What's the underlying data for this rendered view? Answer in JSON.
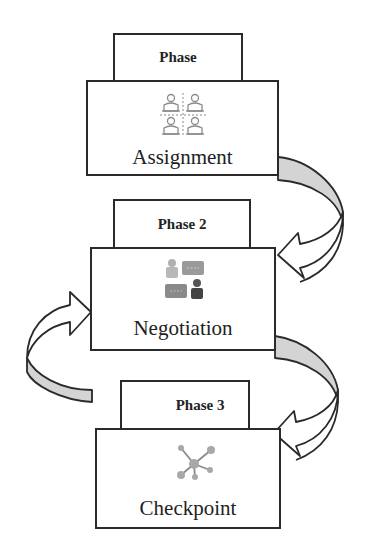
{
  "diagram": {
    "type": "cyclic-phase-flow",
    "phases": [
      {
        "tab_label": "Phase",
        "title": "Assignment",
        "icon": "people-grid-icon"
      },
      {
        "tab_label": "Phase 2",
        "title": "Negotiation",
        "icon": "negotiation-chat-icon"
      },
      {
        "tab_label": "Phase 3",
        "title": "Checkpoint",
        "icon": "network-hub-icon"
      }
    ],
    "arrows": [
      {
        "from": "Assignment",
        "to": "Negotiation",
        "side": "right"
      },
      {
        "from": "Negotiation",
        "to": "Checkpoint",
        "side": "right"
      },
      {
        "from": "Checkpoint",
        "to": "Negotiation",
        "side": "left"
      }
    ],
    "colors": {
      "stroke": "#2a2a2a",
      "arrow_fill": "#d4d4d4",
      "icon_gray": "#8a8a8a"
    }
  }
}
